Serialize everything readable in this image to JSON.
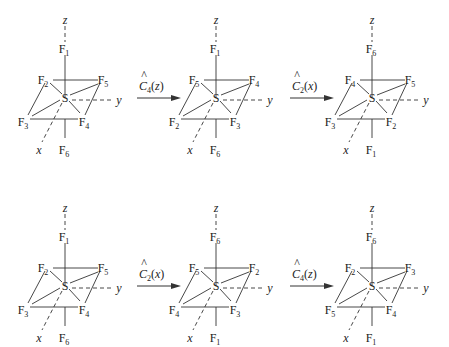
{
  "rows": [
    {
      "molecules": [
        {
          "axial_top": "1",
          "top_left": "2",
          "top_right": "5",
          "bottom_left": "3",
          "bottom_right": "4",
          "axial_bottom": "6"
        },
        {
          "axial_top": "1",
          "top_left": "5",
          "top_right": "4",
          "bottom_left": "2",
          "bottom_right": "3",
          "axial_bottom": "6"
        },
        {
          "axial_top": "6",
          "top_left": "4",
          "top_right": "5",
          "bottom_left": "3",
          "bottom_right": "2",
          "axial_bottom": "1"
        }
      ],
      "arrows": [
        {
          "operator": "C",
          "subscript": "4",
          "axis": "z"
        },
        {
          "operator": "C",
          "subscript": "2",
          "axis": "x"
        }
      ]
    },
    {
      "molecules": [
        {
          "axial_top": "1",
          "top_left": "2",
          "top_right": "5",
          "bottom_left": "3",
          "bottom_right": "4",
          "axial_bottom": "6"
        },
        {
          "axial_top": "6",
          "top_left": "5",
          "top_right": "2",
          "bottom_left": "4",
          "bottom_right": "3",
          "axial_bottom": "1"
        },
        {
          "axial_top": "6",
          "top_left": "2",
          "top_right": "3",
          "bottom_left": "5",
          "bottom_right": "4",
          "axial_bottom": "1"
        }
      ],
      "arrows": [
        {
          "operator": "C",
          "subscript": "2",
          "axis": "x"
        },
        {
          "operator": "C",
          "subscript": "4",
          "axis": "z"
        }
      ]
    }
  ],
  "labels": {
    "element_F": "F",
    "element_S": "S",
    "axis_x": "x",
    "axis_y": "y",
    "axis_z": "z",
    "hat": "^"
  }
}
